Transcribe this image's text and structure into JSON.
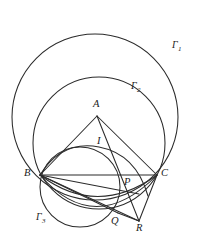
{
  "figure": {
    "kind": "euclidean-geometry-diagram",
    "width": 201,
    "height": 245,
    "background_color": "#ffffff",
    "stroke_color": "#2b2b2b"
  },
  "labels": {
    "gamma1": "Γ",
    "gamma1_sub": "1",
    "gamma2": "Γ",
    "gamma2_sub": "2",
    "gamma3": "Γ",
    "gamma3_sub": "3",
    "A": "A",
    "B": "B",
    "C": "C",
    "I": "I",
    "P": "P",
    "Q": "Q",
    "R": "R"
  },
  "points": {
    "A": {
      "x": 97,
      "y": 116
    },
    "B": {
      "x": 40,
      "y": 175
    },
    "C": {
      "x": 157,
      "y": 175
    },
    "I": {
      "x": 98,
      "y": 152
    },
    "P": {
      "x": 122,
      "y": 188
    },
    "Q": {
      "x": 118,
      "y": 213
    },
    "R": {
      "x": 139,
      "y": 221
    }
  },
  "circles": [
    {
      "name": "gamma1",
      "cx": 95,
      "cy": 117,
      "r": 83
    },
    {
      "name": "gamma2",
      "cx": 99,
      "cy": 143,
      "r": 66
    },
    {
      "name": "gamma3",
      "cx": 80,
      "cy": 187,
      "r": 40
    }
  ],
  "segments": [
    {
      "name": "AB",
      "from": "A",
      "to": "B"
    },
    {
      "name": "AC",
      "from": "A",
      "to": "C"
    },
    {
      "name": "BC",
      "from": "B",
      "to": "C"
    },
    {
      "name": "BR",
      "from": "B",
      "to": "R"
    },
    {
      "name": "BQ",
      "from": "B",
      "to": "Q"
    },
    {
      "name": "BP",
      "from": "B",
      "to": "P"
    },
    {
      "name": "CR",
      "from": "C",
      "to": "R"
    },
    {
      "name": "QR",
      "from": "Q",
      "to": "R"
    },
    {
      "name": "AR",
      "from": "A",
      "to": "R"
    }
  ],
  "label_positions": {
    "gamma1": {
      "x": 172,
      "y": 40
    },
    "gamma2": {
      "x": 131,
      "y": 81
    },
    "gamma3": {
      "x": 36,
      "y": 212
    },
    "A": {
      "x": 93,
      "y": 99
    },
    "B": {
      "x": 24,
      "y": 168
    },
    "C": {
      "x": 161,
      "y": 168
    },
    "I": {
      "x": 97,
      "y": 136
    },
    "P": {
      "x": 124,
      "y": 177
    },
    "Q": {
      "x": 111,
      "y": 216
    },
    "R": {
      "x": 136,
      "y": 223
    }
  }
}
